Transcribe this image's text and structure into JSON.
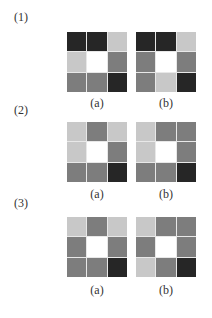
{
  "palette": {
    "white": "#ffffff",
    "light": "#c8c8c8",
    "mid": "#7d7d7d",
    "dark": "#262626"
  },
  "rows": [
    {
      "label": "(1)",
      "panels": [
        {
          "label": "(a)",
          "cells": [
            "dark",
            "dark",
            "light",
            "light",
            "white",
            "mid",
            "mid",
            "mid",
            "dark"
          ]
        },
        {
          "label": "(b)",
          "cells": [
            "dark",
            "dark",
            "light",
            "mid",
            "white",
            "mid",
            "mid",
            "light",
            "dark"
          ]
        }
      ]
    },
    {
      "label": "(2)",
      "panels": [
        {
          "label": "(a)",
          "cells": [
            "light",
            "mid",
            "light",
            "light",
            "white",
            "mid",
            "mid",
            "mid",
            "dark"
          ]
        },
        {
          "label": "(b)",
          "cells": [
            "light",
            "mid",
            "mid",
            "light",
            "white",
            "mid",
            "mid",
            "mid",
            "dark"
          ]
        }
      ]
    },
    {
      "label": "(3)",
      "panels": [
        {
          "label": "(a)",
          "cells": [
            "light",
            "mid",
            "light",
            "mid",
            "white",
            "mid",
            "mid",
            "mid",
            "dark"
          ]
        },
        {
          "label": "(b)",
          "cells": [
            "light",
            "mid",
            "mid",
            "mid",
            "white",
            "mid",
            "light",
            "mid",
            "dark"
          ]
        }
      ]
    }
  ]
}
